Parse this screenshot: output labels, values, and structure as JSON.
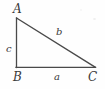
{
  "figure": {
    "kind": "right-triangle-diagram",
    "background_color": "#fefefe",
    "stroke_color": "#4a4a4a",
    "text_color": "#3a3a3a",
    "width": 105,
    "height": 89,
    "vertices": [
      {
        "name": "A",
        "label": "A",
        "x": 16,
        "y": 18
      },
      {
        "name": "B",
        "label": "B",
        "x": 16,
        "y": 67
      },
      {
        "name": "C",
        "label": "C",
        "x": 95,
        "y": 67
      }
    ],
    "sides": [
      {
        "name": "a",
        "label": "a",
        "from": "B",
        "to": "C",
        "role": "base"
      },
      {
        "name": "b",
        "label": "b",
        "from": "A",
        "to": "C",
        "role": "hypotenuse"
      },
      {
        "name": "c",
        "label": "c",
        "from": "A",
        "to": "B",
        "role": "vertical-leg"
      }
    ],
    "right_angle_at": "B"
  }
}
